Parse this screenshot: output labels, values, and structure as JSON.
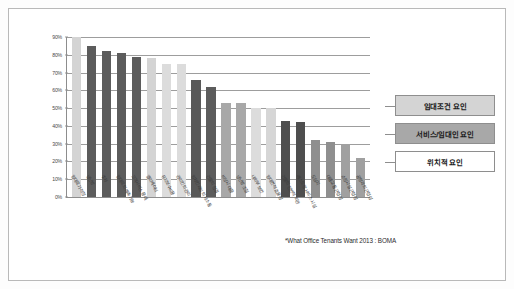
{
  "chart_data": {
    "type": "bar",
    "title": "",
    "xlabel": "",
    "ylabel": "",
    "ylim": [
      0,
      90
    ],
    "grid": true,
    "legend_position": "right",
    "ytick_labels": [
      "90%",
      "80%",
      "70%",
      "60%",
      "50%",
      "40%",
      "30%",
      "20%",
      "10%",
      "0%"
    ],
    "ytick_values": [
      90,
      80,
      70,
      60,
      50,
      40,
      30,
      20,
      10,
      0
    ],
    "categories": [
      "임대료가 적정",
      "냉난방",
      "주차",
      "임대료의 예측가능",
      "고객서비스 응대",
      "엘리베이터",
      "유지보수비용",
      "관리인의 관리",
      "임차인과의 의사소통",
      "건물의 청결",
      "비상시 대응",
      "냉난방 조절",
      "내외부 보안",
      "임대면적 효율성",
      "건물의 전반적 외관",
      "레스토랑 서비스 시설",
      "도심지",
      "대중교통 근접성",
      "쇼핑시설 근접성",
      "공항과의 근접성"
    ],
    "values": [
      90,
      85,
      82,
      81,
      79,
      78,
      75,
      75,
      66,
      62,
      53,
      53,
      50,
      50,
      43,
      42,
      32,
      31,
      30,
      22
    ],
    "series_group": [
      "lease",
      "service",
      "location",
      "lease",
      "service",
      "lease",
      "lease",
      "lease",
      "service",
      "service",
      "location",
      "location",
      "lease",
      "service",
      "service",
      "service",
      "location",
      "location",
      "lease",
      "location"
    ],
    "bar_colors": [
      "#d4d4d4",
      "#5c5c5c",
      "#5c5c5c",
      "#5c5c5c",
      "#5c5c5c",
      "#d4d4d4",
      "#dcdcdc",
      "#dcdcdc",
      "#595959",
      "#5c5c5c",
      "#a8a8a8",
      "#a8a8a8",
      "#dcdcdc",
      "#d6d6d6",
      "#4e4e4e",
      "#4e4e4e",
      "#8f8f8f",
      "#8f8f8f",
      "#a0a0a0",
      "#a0a0a0"
    ],
    "legend": [
      {
        "label": "임대조건 요인",
        "color": "#d4d4d4"
      },
      {
        "label": "서비스/임대인 요인",
        "color": "#a8a8a8"
      },
      {
        "label": "위치적 요인",
        "color": "#ffffff"
      }
    ],
    "footnote": "*What Office Tenants Want 2013 : BOMA"
  }
}
